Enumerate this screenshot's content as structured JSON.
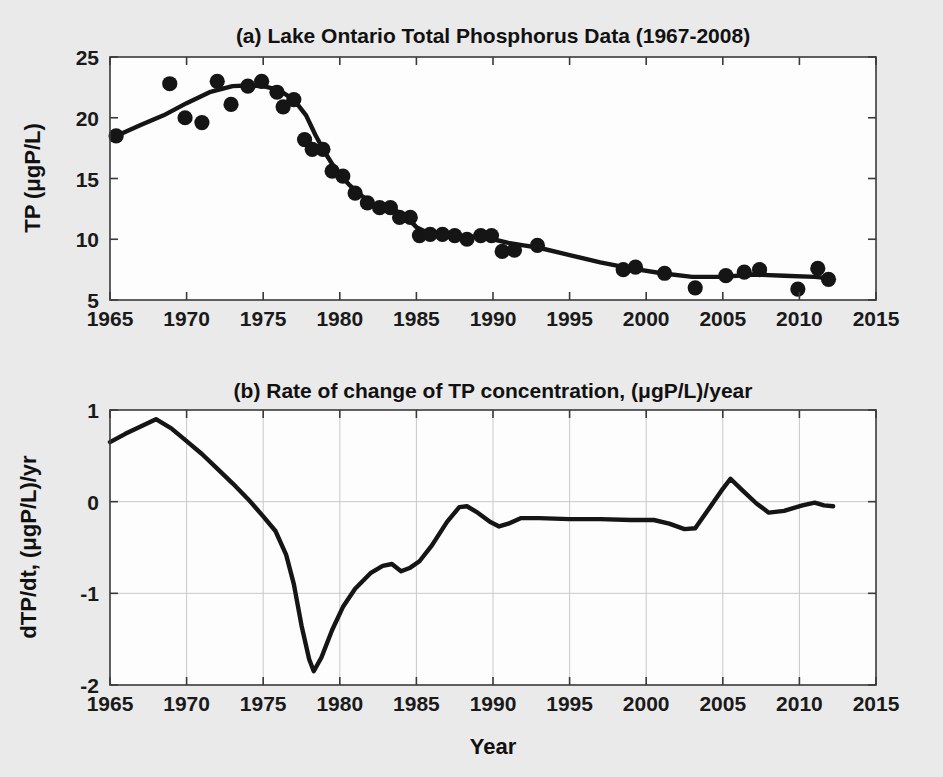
{
  "figure": {
    "background_color": "#eaeaea",
    "plot_background_color": "#fdfdfd",
    "line_color": "#151515",
    "marker_color": "#151515",
    "axis_color": "#3a3a3a",
    "grid_color": "#c9c9c9"
  },
  "panel_a": {
    "title": "(a) Lake Ontario Total Phosphorus Data (1967-2008)",
    "ylabel": "TP (μgP/L)",
    "ytick_labels": [
      "25",
      "20",
      "15",
      "10",
      "5"
    ],
    "xtick_labels": [
      "1965",
      "1970",
      "1975",
      "1980",
      "1985",
      "1990",
      "1995",
      "2000",
      "2005",
      "2010",
      "2015"
    ]
  },
  "panel_b": {
    "title": "(b) Rate of change of TP concentration, (μgP/L)/year",
    "ylabel": "dTP/dt, (μgP/L)/yr",
    "xlabel": "Year",
    "ytick_labels": [
      "1",
      "0",
      "-1",
      "-2"
    ],
    "xtick_labels": [
      "1965",
      "1970",
      "1975",
      "1980",
      "1985",
      "1990",
      "1995",
      "2000",
      "2005",
      "2010",
      "2015"
    ]
  },
  "chart_data": [
    {
      "id": "panel_a",
      "type": "scatter",
      "title": "(a) Lake Ontario Total Phosphorus Data (1967-2008)",
      "xlabel": "",
      "ylabel": "TP (μgP/L)",
      "xlim": [
        1965,
        2015
      ],
      "ylim": [
        5,
        25
      ],
      "xticks": [
        1965,
        1970,
        1975,
        1980,
        1985,
        1990,
        1995,
        2000,
        2005,
        2010,
        2015
      ],
      "yticks": [
        5,
        10,
        15,
        20,
        25
      ],
      "grid": false,
      "legend": "none",
      "series": [
        {
          "name": "Observed TP",
          "type": "scatter",
          "marker": "filled-circle",
          "points": [
            [
              1965.4,
              18.5
            ],
            [
              1968.9,
              22.8
            ],
            [
              1969.9,
              20.0
            ],
            [
              1971.0,
              19.6
            ],
            [
              1972.0,
              23.0
            ],
            [
              1972.9,
              21.1
            ],
            [
              1974.0,
              22.6
            ],
            [
              1974.9,
              23.0
            ],
            [
              1975.9,
              22.1
            ],
            [
              1976.3,
              20.9
            ],
            [
              1977.0,
              21.5
            ],
            [
              1977.7,
              18.2
            ],
            [
              1978.2,
              17.4
            ],
            [
              1978.9,
              17.4
            ],
            [
              1979.5,
              15.6
            ],
            [
              1980.2,
              15.2
            ],
            [
              1981.0,
              13.8
            ],
            [
              1981.8,
              13.0
            ],
            [
              1982.6,
              12.6
            ],
            [
              1983.3,
              12.6
            ],
            [
              1983.9,
              11.8
            ],
            [
              1984.6,
              11.8
            ],
            [
              1985.2,
              10.3
            ],
            [
              1985.9,
              10.4
            ],
            [
              1986.7,
              10.4
            ],
            [
              1987.5,
              10.3
            ],
            [
              1988.3,
              10.0
            ],
            [
              1989.2,
              10.3
            ],
            [
              1989.9,
              10.3
            ],
            [
              1990.6,
              9.0
            ],
            [
              1991.4,
              9.1
            ],
            [
              1992.9,
              9.5
            ],
            [
              1998.5,
              7.5
            ],
            [
              1999.3,
              7.7
            ],
            [
              2001.2,
              7.2
            ],
            [
              2003.2,
              6.0
            ],
            [
              2005.2,
              7.0
            ],
            [
              2006.4,
              7.3
            ],
            [
              2007.4,
              7.5
            ],
            [
              2009.9,
              5.9
            ],
            [
              2011.2,
              7.6
            ],
            [
              2011.9,
              6.7
            ]
          ]
        },
        {
          "name": "Smoothed TP trend",
          "type": "line",
          "points": [
            [
              1965.4,
              18.5
            ],
            [
              1967.0,
              19.4
            ],
            [
              1968.5,
              20.2
            ],
            [
              1970.0,
              21.2
            ],
            [
              1971.5,
              22.1
            ],
            [
              1973.0,
              22.6
            ],
            [
              1974.0,
              22.65
            ],
            [
              1975.0,
              22.6
            ],
            [
              1976.0,
              22.3
            ],
            [
              1977.0,
              21.5
            ],
            [
              1977.8,
              20.2
            ],
            [
              1978.4,
              18.6
            ],
            [
              1979.0,
              17.2
            ],
            [
              1979.8,
              15.6
            ],
            [
              1980.6,
              14.5
            ],
            [
              1981.4,
              13.6
            ],
            [
              1982.2,
              12.9
            ],
            [
              1983.0,
              12.6
            ],
            [
              1983.6,
              12.4
            ],
            [
              1984.3,
              11.9
            ],
            [
              1985.0,
              11.0
            ],
            [
              1985.8,
              10.5
            ],
            [
              1986.8,
              10.3
            ],
            [
              1988.0,
              10.2
            ],
            [
              1989.0,
              10.2
            ],
            [
              1990.0,
              10.0
            ],
            [
              1991.0,
              9.7
            ],
            [
              1992.0,
              9.5
            ],
            [
              1993.0,
              9.3
            ],
            [
              1995.0,
              8.7
            ],
            [
              1997.0,
              8.1
            ],
            [
              1999.0,
              7.6
            ],
            [
              2001.0,
              7.2
            ],
            [
              2003.0,
              6.9
            ],
            [
              2005.0,
              6.9
            ],
            [
              2007.0,
              7.1
            ],
            [
              2009.0,
              7.0
            ],
            [
              2011.0,
              6.9
            ],
            [
              2011.9,
              6.8
            ]
          ]
        }
      ]
    },
    {
      "id": "panel_b",
      "type": "line",
      "title": "(b) Rate of change of TP concentration, (μgP/L)/year",
      "xlabel": "Year",
      "ylabel": "dTP/dt, (μgP/L)/yr",
      "xlim": [
        1965,
        2015
      ],
      "ylim": [
        -2,
        1
      ],
      "xticks": [
        1965,
        1970,
        1975,
        1980,
        1985,
        1990,
        1995,
        2000,
        2005,
        2010,
        2015
      ],
      "yticks": [
        -2,
        -1,
        0,
        1
      ],
      "grid": true,
      "legend": "none",
      "series": [
        {
          "name": "dTP/dt",
          "type": "line",
          "points": [
            [
              1965.0,
              0.65
            ],
            [
              1966.0,
              0.74
            ],
            [
              1967.0,
              0.82
            ],
            [
              1968.0,
              0.9
            ],
            [
              1969.0,
              0.8
            ],
            [
              1970.0,
              0.66
            ],
            [
              1971.0,
              0.52
            ],
            [
              1972.0,
              0.36
            ],
            [
              1973.0,
              0.2
            ],
            [
              1974.0,
              0.03
            ],
            [
              1975.0,
              -0.16
            ],
            [
              1975.8,
              -0.32
            ],
            [
              1976.5,
              -0.58
            ],
            [
              1977.0,
              -0.9
            ],
            [
              1977.5,
              -1.35
            ],
            [
              1978.0,
              -1.72
            ],
            [
              1978.3,
              -1.85
            ],
            [
              1978.8,
              -1.7
            ],
            [
              1979.5,
              -1.4
            ],
            [
              1980.2,
              -1.15
            ],
            [
              1981.0,
              -0.95
            ],
            [
              1982.0,
              -0.78
            ],
            [
              1982.8,
              -0.7
            ],
            [
              1983.4,
              -0.68
            ],
            [
              1984.0,
              -0.76
            ],
            [
              1984.6,
              -0.72
            ],
            [
              1985.2,
              -0.65
            ],
            [
              1986.0,
              -0.48
            ],
            [
              1987.0,
              -0.22
            ],
            [
              1987.8,
              -0.06
            ],
            [
              1988.3,
              -0.05
            ],
            [
              1989.0,
              -0.12
            ],
            [
              1989.8,
              -0.22
            ],
            [
              1990.4,
              -0.27
            ],
            [
              1991.0,
              -0.24
            ],
            [
              1991.8,
              -0.18
            ],
            [
              1993.0,
              -0.18
            ],
            [
              1995.0,
              -0.19
            ],
            [
              1997.0,
              -0.19
            ],
            [
              1999.0,
              -0.2
            ],
            [
              2000.5,
              -0.2
            ],
            [
              2001.5,
              -0.24
            ],
            [
              2002.5,
              -0.3
            ],
            [
              2003.2,
              -0.29
            ],
            [
              2004.0,
              -0.1
            ],
            [
              2005.0,
              0.14
            ],
            [
              2005.5,
              0.25
            ],
            [
              2006.3,
              0.12
            ],
            [
              2007.2,
              -0.02
            ],
            [
              2008.0,
              -0.12
            ],
            [
              2009.0,
              -0.1
            ],
            [
              2010.2,
              -0.04
            ],
            [
              2011.0,
              -0.01
            ],
            [
              2011.6,
              -0.04
            ],
            [
              2012.2,
              -0.05
            ]
          ]
        }
      ]
    }
  ]
}
